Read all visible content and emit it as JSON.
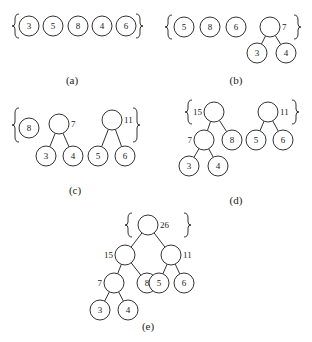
{
  "initial_weights": [
    3,
    5,
    8,
    4,
    6
  ],
  "panels": [
    {
      "id": "a",
      "caption": "(a)",
      "forest": [
        {
          "weight": 3
        },
        {
          "weight": 5
        },
        {
          "weight": 8
        },
        {
          "weight": 4
        },
        {
          "weight": 6
        }
      ]
    },
    {
      "id": "b",
      "caption": "(b)",
      "forest": [
        {
          "weight": 5
        },
        {
          "weight": 8
        },
        {
          "weight": 6
        },
        {
          "weight": 7,
          "children": [
            {
              "weight": 3
            },
            {
              "weight": 4
            }
          ]
        }
      ]
    },
    {
      "id": "c",
      "caption": "(c)",
      "forest": [
        {
          "weight": 8
        },
        {
          "weight": 7,
          "children": [
            {
              "weight": 3
            },
            {
              "weight": 4
            }
          ]
        },
        {
          "weight": 11,
          "children": [
            {
              "weight": 5
            },
            {
              "weight": 6
            }
          ]
        }
      ]
    },
    {
      "id": "d",
      "caption": "(d)",
      "forest": [
        {
          "weight": 15,
          "children": [
            {
              "weight": 7,
              "children": [
                {
                  "weight": 3
                },
                {
                  "weight": 4
                }
              ]
            },
            {
              "weight": 8
            }
          ]
        },
        {
          "weight": 11,
          "children": [
            {
              "weight": 5
            },
            {
              "weight": 6
            }
          ]
        }
      ]
    },
    {
      "id": "e",
      "caption": "(e)",
      "forest": [
        {
          "weight": 26,
          "children": [
            {
              "weight": 15,
              "children": [
                {
                  "weight": 7,
                  "children": [
                    {
                      "weight": 3
                    },
                    {
                      "weight": 4
                    }
                  ]
                },
                {
                  "weight": 8
                }
              ]
            },
            {
              "weight": 11,
              "children": [
                {
                  "weight": 5
                },
                {
                  "weight": 6
                }
              ]
            }
          ]
        }
      ]
    }
  ]
}
